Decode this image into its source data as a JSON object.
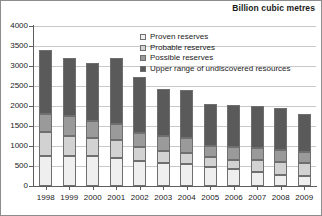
{
  "chart": {
    "title": "Billion cubic metres",
    "y_axis_ticks": [
      "0",
      "500",
      "1000",
      "1500",
      "2000",
      "2500",
      "3000",
      "3500",
      "4000"
    ],
    "legend": [
      {
        "label": "Proven reserves",
        "color": "#efefef",
        "key": "proven"
      },
      {
        "label": "Probable reserves",
        "color": "#d2d2d2",
        "key": "probable"
      },
      {
        "label": "Possible reserves",
        "color": "#9a9a9a",
        "key": "possible"
      },
      {
        "label": "Upper range of undiscovered resources",
        "color": "#5a5a5a",
        "key": "upper"
      }
    ]
  },
  "chart_data": {
    "type": "bar",
    "subtype": "stacked-vertical",
    "title": "Billion cubic metres",
    "xlabel": "",
    "ylabel": "Billion cubic metres",
    "ylim": [
      0,
      4000
    ],
    "ytick_step": 500,
    "yticks": [
      0,
      500,
      1000,
      1500,
      2000,
      2500,
      3000,
      3500,
      4000
    ],
    "grid": true,
    "grid_axis": "y",
    "legend_position": "inside-top-center",
    "categories": [
      "1998",
      "1999",
      "2000",
      "2001",
      "2002",
      "2003",
      "2004",
      "2005",
      "2006",
      "2007",
      "2008",
      "2009"
    ],
    "series": [
      {
        "name": "Proven reserves",
        "color": "#efefef",
        "values": [
          760,
          760,
          740,
          700,
          630,
          580,
          540,
          480,
          420,
          350,
          280,
          250
        ]
      },
      {
        "name": "Probable reserves",
        "color": "#d2d2d2",
        "values": [
          590,
          490,
          460,
          440,
          340,
          300,
          290,
          250,
          240,
          300,
          320,
          330
        ]
      },
      {
        "name": "Possible reserves",
        "color": "#9a9a9a",
        "values": [
          450,
          500,
          430,
          420,
          360,
          370,
          370,
          280,
          310,
          290,
          300,
          260
        ]
      },
      {
        "name": "Upper range of undiscovered resources",
        "color": "#5a5a5a",
        "values": [
          1590,
          1460,
          1440,
          1650,
          1390,
          1180,
          1210,
          1040,
          1060,
          1060,
          1060,
          950
        ]
      }
    ],
    "totals": [
      3390,
      3210,
      3070,
      3210,
      2720,
      2430,
      2410,
      2050,
      2030,
      2000,
      1960,
      1790
    ]
  }
}
